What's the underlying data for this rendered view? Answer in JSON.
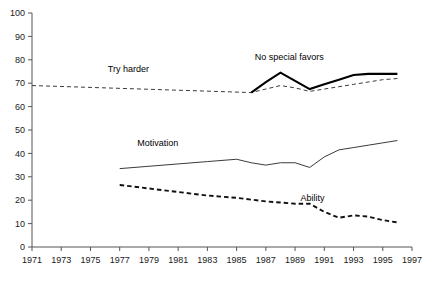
{
  "chart_data": {
    "type": "line",
    "title": "",
    "subtitle": "",
    "xlabel": "",
    "ylabel": "",
    "xlim": [
      1971,
      1997
    ],
    "ylim": [
      0,
      100
    ],
    "grid": false,
    "legend": "inline-annotations",
    "y_ticks": [
      "0",
      "10",
      "20",
      "30",
      "40",
      "50",
      "60",
      "70",
      "80",
      "90",
      "100"
    ],
    "x_ticks": [
      "1971",
      "1973",
      "1975",
      "1977",
      "1979",
      "1981",
      "1983",
      "1985",
      "1987",
      "1989",
      "1991",
      "1993",
      "1995",
      "1997"
    ],
    "series": [
      {
        "name": "Try harder",
        "style": "dashed",
        "weight": "thin",
        "label_x": 1977.6,
        "label_y": 75,
        "x": [
          1971,
          1986,
          1987,
          1988,
          1989,
          1990,
          1991,
          1992,
          1993,
          1994,
          1995,
          1996
        ],
        "values": [
          69,
          66,
          67.5,
          69,
          68,
          66.5,
          67.5,
          68.5,
          69.5,
          70.5,
          71.5,
          72
        ]
      },
      {
        "name": "No special favors",
        "style": "solid",
        "weight": "bold",
        "label_x": 1988.6,
        "label_y": 80,
        "x": [
          1986,
          1987,
          1988,
          1989,
          1990,
          1991,
          1992,
          1993,
          1994,
          1995,
          1996
        ],
        "values": [
          66,
          70.5,
          74.5,
          71,
          67.5,
          69.5,
          71.5,
          73.5,
          74,
          74,
          74
        ]
      },
      {
        "name": "Motivation",
        "style": "solid",
        "weight": "thin",
        "label_x": 1979.6,
        "label_y": 43,
        "x": [
          1977,
          1979,
          1981,
          1983,
          1985,
          1986,
          1987,
          1988,
          1989,
          1990,
          1991,
          1992,
          1993,
          1994,
          1995,
          1996
        ],
        "values": [
          33.5,
          34.5,
          35.5,
          36.5,
          37.5,
          36,
          35,
          36,
          36,
          34,
          38.5,
          41.5,
          42.5,
          43.5,
          44.5,
          45.5
        ]
      },
      {
        "name": "Ability",
        "style": "dashed",
        "weight": "bold",
        "label_x": 1990.2,
        "label_y": 19.5,
        "x": [
          1977,
          1979,
          1981,
          1983,
          1985,
          1987,
          1989,
          1990,
          1991,
          1992,
          1993,
          1994,
          1995,
          1996
        ],
        "values": [
          26.5,
          25,
          23.5,
          22,
          21,
          19.5,
          18.5,
          18.5,
          15,
          12.5,
          13.5,
          13,
          11.5,
          10.5
        ]
      }
    ]
  },
  "colors": {
    "axis": "#555555",
    "ink": "#1a1a1a",
    "background": "#ffffff"
  }
}
